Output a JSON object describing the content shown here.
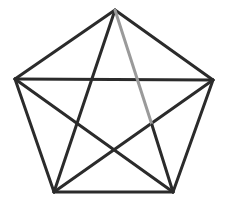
{
  "diagram": {
    "background": "#ffffff",
    "stroke_dark": "#2b2b2b",
    "stroke_light": "#9a9a9a",
    "stroke_width": 3,
    "vertices": [
      {
        "id": "A",
        "x": 115,
        "y": 10
      },
      {
        "id": "B",
        "x": 213,
        "y": 80
      },
      {
        "id": "C",
        "x": 173,
        "y": 192
      },
      {
        "id": "D",
        "x": 54,
        "y": 192
      },
      {
        "id": "E",
        "x": 15,
        "y": 79
      }
    ],
    "edges": [
      {
        "from": "A",
        "to": "B",
        "style": "dark"
      },
      {
        "from": "B",
        "to": "C",
        "style": "dark"
      },
      {
        "from": "C",
        "to": "D",
        "style": "dark"
      },
      {
        "from": "D",
        "to": "E",
        "style": "dark"
      },
      {
        "from": "E",
        "to": "A",
        "style": "dark"
      },
      {
        "from": "E",
        "to": "B",
        "style": "dark"
      },
      {
        "from": "A",
        "to": "D",
        "style": "dark"
      },
      {
        "from": "E",
        "to": "C",
        "style": "dark"
      },
      {
        "from": "D",
        "to": "B",
        "style": "dark"
      },
      {
        "from": "A",
        "to": "C",
        "style": "partial-light",
        "light_until": {
          "x": 152,
          "y": 125
        }
      }
    ]
  }
}
